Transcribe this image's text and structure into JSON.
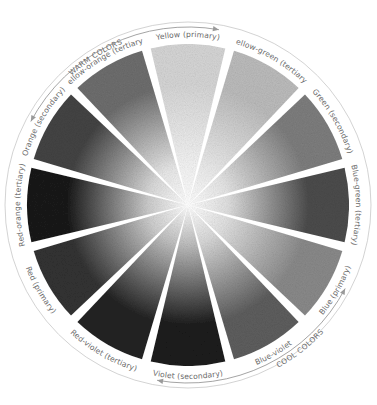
{
  "wheel": {
    "center": [
      188,
      205
    ],
    "ring_radius": 183,
    "paint_radius": 161,
    "label_radius": 168,
    "segments": [
      {
        "label": "Yellow (primary)",
        "tone": "#d6d6d6",
        "inner": "#f4f4f4"
      },
      {
        "label": "Yellow-green (tertiary)",
        "tone": "#bcbcbc",
        "inner": "#ececec"
      },
      {
        "label": "Green (secondary)",
        "tone": "#7e7e7e",
        "inner": "#e6e6e6"
      },
      {
        "label": "Blue-green (tertiary)",
        "tone": "#4c4c4c",
        "inner": "#e0e0e0"
      },
      {
        "label": "Blue (primary)",
        "tone": "#8a8a8a",
        "inner": "#e2e2e2"
      },
      {
        "label": "Blue-violet",
        "tone": "#5e5e5e",
        "inner": "#d8d8d8"
      },
      {
        "label": "Violet (secondary)",
        "tone": "#1c1c1c",
        "inner": "#bdbdbd"
      },
      {
        "label": "Red-violet (tertiary)",
        "tone": "#242424",
        "inner": "#c2c2c2"
      },
      {
        "label": "Red (primary)",
        "tone": "#333333",
        "inner": "#cfcfcf"
      },
      {
        "label": "Red-orange (tertiary)",
        "tone": "#1a1a1a",
        "inner": "#cccccc"
      },
      {
        "label": "Orange (secondary)",
        "tone": "#444444",
        "inner": "#dadada"
      },
      {
        "label": "Yellow-orange (tertiary)",
        "tone": "#6e6e6e",
        "inner": "#e8e8e8"
      }
    ],
    "groups": {
      "warm": {
        "label": "WARM COLORS"
      },
      "cool": {
        "label": "COOL COLORS"
      }
    },
    "colors": {
      "ring_stroke": "#c8c8c8",
      "arrow": "#9a9a9a",
      "text": "#6a6a6a",
      "gap": "#ffffff"
    }
  }
}
